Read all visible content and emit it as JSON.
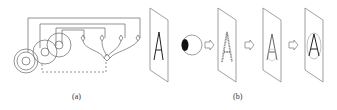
{
  "figure": {
    "panel_a": {
      "label": "(a)",
      "description": "neural retina schematic connected to neurons with letter plane",
      "plane_letter": "A"
    },
    "panel_b": {
      "label": "(b)",
      "eye": "eye-icon",
      "stages": [
        {
          "letter": "A",
          "style": "noisy"
        },
        {
          "letter": "A",
          "style": "outline"
        },
        {
          "letter": "A",
          "style": "circled"
        }
      ],
      "arrow": "hollow-right-arrow"
    },
    "colors": {
      "stroke": "#555555",
      "ink": "#222222"
    }
  }
}
